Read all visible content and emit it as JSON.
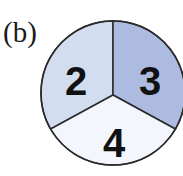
{
  "figure": {
    "label": "(b)",
    "circle": {
      "cx": 113,
      "cy": 93,
      "r": 72,
      "stroke": "#2a2a2a"
    },
    "segments": [
      {
        "value": "2",
        "color": "#d3ddf0",
        "position": "upper-left"
      },
      {
        "value": "3",
        "color": "#aebbe0",
        "position": "upper-right"
      },
      {
        "value": "4",
        "color": "#f3f6fc",
        "position": "bottom"
      }
    ]
  }
}
